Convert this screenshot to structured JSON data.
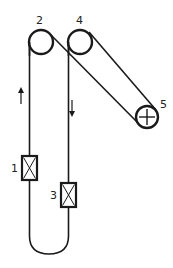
{
  "diagram": {
    "type": "belt-pulley-schematic",
    "labels": {
      "box1": "1",
      "pulley2": "2",
      "box3": "3",
      "pulley4": "4",
      "pulley5": "5"
    },
    "arrows": {
      "left": "up",
      "right": "down"
    },
    "colors": {
      "stroke": "#1a1a1a",
      "background": "#ffffff"
    }
  }
}
